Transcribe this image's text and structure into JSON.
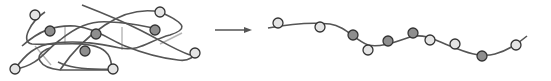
{
  "diagram": {
    "colors": {
      "curve": "#555555",
      "connector": "#b5b5b5",
      "node_stroke": "#333333",
      "node_light": "#e4e4e4",
      "node_dark": "#8e8e8e",
      "arrow": "#555555"
    },
    "left_panel": {
      "label": "tangled-manifold",
      "nodes": [
        {
          "id": "n1",
          "shade": "light"
        },
        {
          "id": "n2",
          "shade": "dark"
        },
        {
          "id": "n3",
          "shade": "dark"
        },
        {
          "id": "n4",
          "shade": "dark"
        },
        {
          "id": "n5",
          "shade": "light"
        },
        {
          "id": "n6",
          "shade": "light"
        },
        {
          "id": "n7",
          "shade": "light"
        },
        {
          "id": "n8",
          "shade": "dark"
        },
        {
          "id": "n9",
          "shade": "light"
        }
      ]
    },
    "arrow": {
      "label": "maps-to"
    },
    "right_panel": {
      "label": "unfolded-curve",
      "nodes": [
        {
          "id": "m1",
          "shade": "light"
        },
        {
          "id": "m2",
          "shade": "light"
        },
        {
          "id": "m3",
          "shade": "dark"
        },
        {
          "id": "m4",
          "shade": "light"
        },
        {
          "id": "m5",
          "shade": "dark"
        },
        {
          "id": "m6",
          "shade": "dark"
        },
        {
          "id": "m7",
          "shade": "light"
        },
        {
          "id": "m8",
          "shade": "light"
        },
        {
          "id": "m9",
          "shade": "dark"
        },
        {
          "id": "m10",
          "shade": "light"
        }
      ]
    }
  }
}
